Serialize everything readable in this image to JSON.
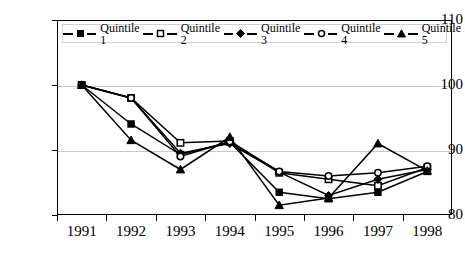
{
  "chart_data": {
    "type": "line",
    "title": "",
    "xlabel": "",
    "ylabel": "",
    "categories": [
      "1991",
      "1992",
      "1993",
      "1994",
      "1995",
      "1996",
      "1997",
      "1998"
    ],
    "ylim": [
      80,
      110
    ],
    "yticks": [
      80,
      90,
      100,
      110
    ],
    "grid": true,
    "legend_position": "top-inside",
    "series": [
      {
        "name": "Quintile 1",
        "marker": "filled-square",
        "values": [
          100,
          94,
          89.3,
          91.2,
          83.5,
          82.5,
          83.5,
          86.7
        ]
      },
      {
        "name": "Quintile 2",
        "marker": "open-square",
        "values": [
          100,
          98,
          91.1,
          91.4,
          86.5,
          85.5,
          84.5,
          87.3
        ]
      },
      {
        "name": "Quintile 3",
        "marker": "filled-diamond",
        "values": [
          100,
          98,
          89.5,
          91.0,
          86.6,
          83.0,
          85.5,
          87.0
        ]
      },
      {
        "name": "Quintile 4",
        "marker": "open-diamond",
        "values": [
          100,
          98,
          89.0,
          91.3,
          86.7,
          86.0,
          86.5,
          87.5
        ]
      },
      {
        "name": "Quintile 5",
        "marker": "filled-triangle",
        "values": [
          100,
          91.5,
          87.0,
          92.0,
          81.5,
          82.6,
          91.0,
          86.8
        ]
      }
    ]
  },
  "axis": {
    "ytick_labels": [
      "110",
      "100",
      "90",
      "80"
    ],
    "xtick_labels": [
      "1991",
      "1992",
      "1993",
      "1994",
      "1995",
      "1996",
      "1997",
      "1998"
    ]
  },
  "legend": {
    "items": [
      {
        "label": "Quintile 1"
      },
      {
        "label": "Quintile 2"
      },
      {
        "label": "Quintile 3"
      },
      {
        "label": "Quintile 4"
      },
      {
        "label": "Quintile 5"
      }
    ]
  }
}
